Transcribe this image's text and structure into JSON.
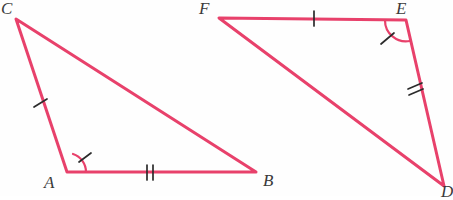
{
  "figure": {
    "background_color": "#fefefe",
    "stroke_color": "#e8416b",
    "mark_color": "#2b2b2b",
    "label_color": "#3a3a3a",
    "stroke_width": 3,
    "mark_width": 1.6,
    "width": 452,
    "height": 196
  },
  "triangles": [
    {
      "name": "triangle-abc",
      "vertices": [
        {
          "label": "C",
          "x": 16,
          "y": 19,
          "label_x": 1,
          "label_y": 2
        },
        {
          "label": "A",
          "x": 67,
          "y": 172,
          "label_x": 44,
          "label_y": 175
        },
        {
          "label": "B",
          "x": 256,
          "y": 172,
          "label_x": 262,
          "label_y": 173
        }
      ],
      "sides": [
        {
          "name": "side-ca",
          "from": "C",
          "to": "A",
          "ticks": 1
        },
        {
          "name": "side-ab",
          "from": "A",
          "to": "B",
          "ticks": 2
        },
        {
          "name": "side-bc",
          "from": "B",
          "to": "C",
          "ticks": 0
        }
      ],
      "angle_marks": [
        {
          "name": "angle-a",
          "at": "A",
          "arcs": 1,
          "tick": true
        }
      ]
    },
    {
      "name": "triangle-def",
      "vertices": [
        {
          "label": "F",
          "x": 219,
          "y": 18,
          "label_x": 199,
          "label_y": 2
        },
        {
          "label": "E",
          "x": 406,
          "y": 20,
          "label_x": 396,
          "label_y": 2
        },
        {
          "label": "D",
          "x": 444,
          "y": 186,
          "label_x": 441,
          "label_y": 184
        }
      ],
      "sides": [
        {
          "name": "side-fe",
          "from": "F",
          "to": "E",
          "ticks": 1
        },
        {
          "name": "side-ed",
          "from": "E",
          "to": "D",
          "ticks": 2
        },
        {
          "name": "side-df",
          "from": "D",
          "to": "F",
          "ticks": 0
        }
      ],
      "angle_marks": [
        {
          "name": "angle-e",
          "at": "E",
          "arcs": 1,
          "tick": true
        }
      ]
    }
  ],
  "labels": {
    "c": "C",
    "a": "A",
    "b": "B",
    "f": "F",
    "e": "E",
    "d": "D"
  }
}
